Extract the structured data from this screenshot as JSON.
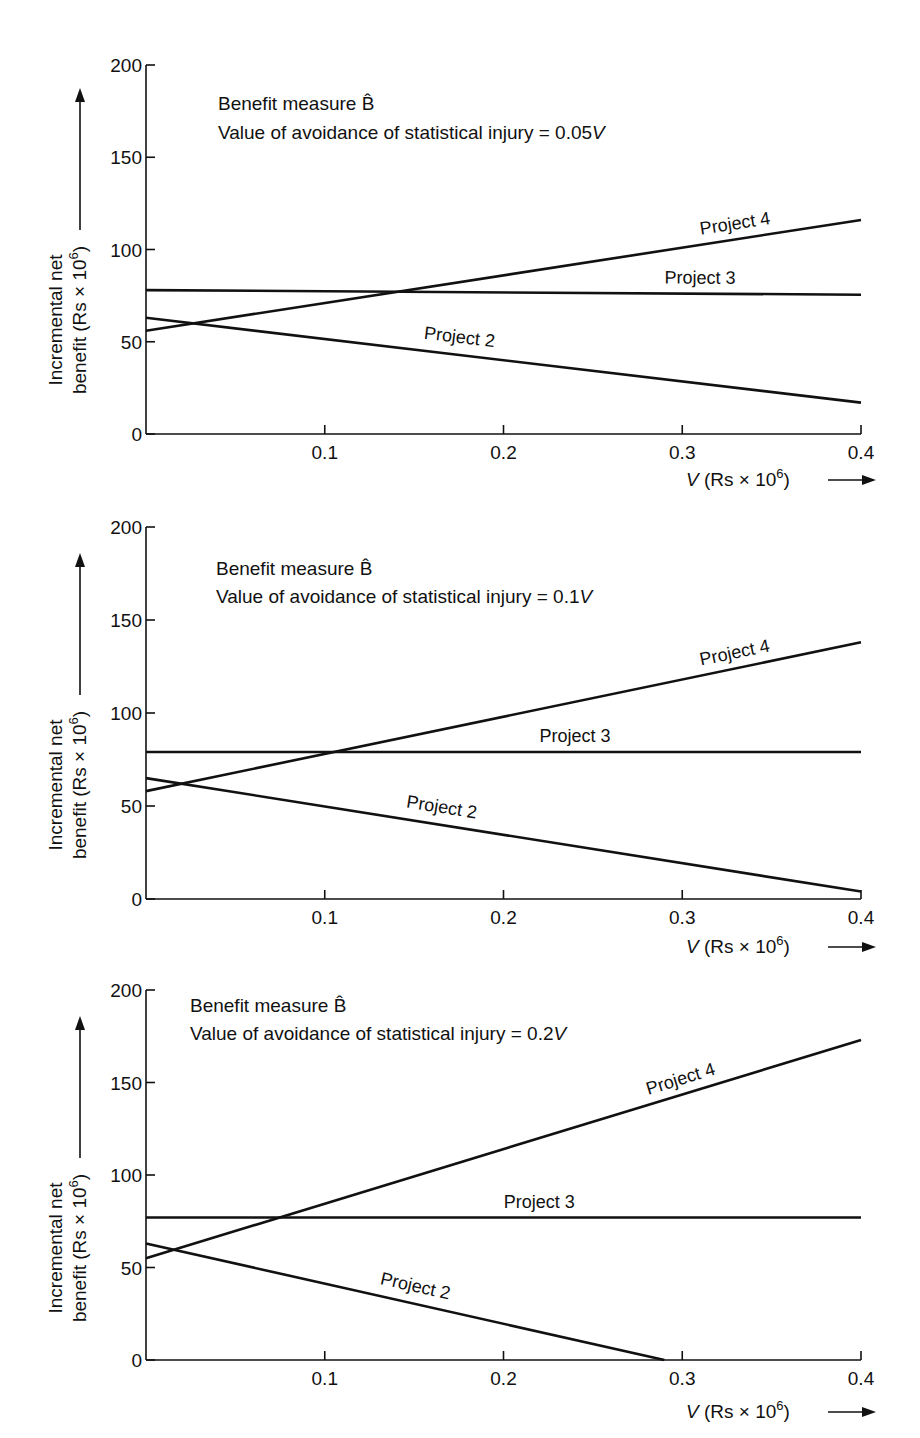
{
  "chart_data": [
    {
      "type": "line",
      "title": "Benefit measure B̂",
      "subtitle": "Value of avoidance of statistical injury = 0.05V",
      "subtitle_prefix": "Value of avoidance of statistical injury = 0.05",
      "subtitle_var": "V",
      "xlabel": "V (Rs × 10⁶)",
      "ylabel": "Incremental net benefit (Rs × 10⁶)",
      "ylabel_line1": "Incremental net",
      "ylabel_line2": "benefit (Rs × 10",
      "x_ticks": [
        "0.1",
        "0.2",
        "0.3",
        "0.4"
      ],
      "y_ticks": [
        "0",
        "50",
        "100",
        "150",
        "200"
      ],
      "xlim": [
        0,
        0.4
      ],
      "ylim": [
        0,
        200
      ],
      "grid": false,
      "x": [
        0,
        0.4
      ],
      "series": [
        {
          "name": "Project 2",
          "values": [
            63,
            17
          ]
        },
        {
          "name": "Project 3",
          "values": [
            78,
            75.5
          ]
        },
        {
          "name": "Project 4",
          "values": [
            56,
            116
          ]
        }
      ]
    },
    {
      "type": "line",
      "title": "Benefit measure B̂",
      "subtitle": "Value of avoidance of statistical injury = 0.1V",
      "subtitle_prefix": "Value of avoidance of statistical injury = 0.1",
      "subtitle_var": "V",
      "xlabel": "V (Rs × 10⁶)",
      "ylabel": "Incremental net benefit (Rs × 10⁶)",
      "ylabel_line1": "Incremental net",
      "ylabel_line2": "benefit (Rs × 10",
      "x_ticks": [
        "0.1",
        "0.2",
        "0.3",
        "0.4"
      ],
      "y_ticks": [
        "0",
        "50",
        "100",
        "150",
        "200"
      ],
      "xlim": [
        0,
        0.4
      ],
      "ylim": [
        0,
        200
      ],
      "grid": false,
      "x": [
        0,
        0.4
      ],
      "series": [
        {
          "name": "Project 2",
          "values": [
            65,
            4
          ]
        },
        {
          "name": "Project 3",
          "values": [
            79,
            79
          ]
        },
        {
          "name": "Project 4",
          "values": [
            58,
            138
          ]
        }
      ]
    },
    {
      "type": "line",
      "title": "Benefit measure B̂",
      "subtitle": "Value of avoidance of statistical injury = 0.2V",
      "subtitle_prefix": "Value of avoidance of statistical injury = 0.2",
      "subtitle_var": "V",
      "xlabel": "V (Rs × 10⁶)",
      "ylabel": "Incremental net benefit (Rs × 10⁶)",
      "ylabel_line1": "Incremental net",
      "ylabel_line2": "benefit (Rs × 10",
      "x_ticks": [
        "0.1",
        "0.2",
        "0.3",
        "0.4"
      ],
      "y_ticks": [
        "0",
        "50",
        "100",
        "150",
        "200"
      ],
      "xlim": [
        0,
        0.4
      ],
      "ylim": [
        0,
        200
      ],
      "grid": false,
      "series": [
        {
          "name": "Project 2",
          "x": [
            0,
            0.29
          ],
          "values": [
            63,
            0
          ]
        },
        {
          "name": "Project 3",
          "x": [
            0,
            0.4
          ],
          "values": [
            77,
            77
          ]
        },
        {
          "name": "Project 4",
          "x": [
            0,
            0.4
          ],
          "values": [
            55,
            173
          ]
        }
      ]
    }
  ],
  "labels": {
    "xlabel_var": "V",
    "xlabel_rest": " (Rs × 10",
    "superscript": "6",
    "close_paren": ")"
  }
}
